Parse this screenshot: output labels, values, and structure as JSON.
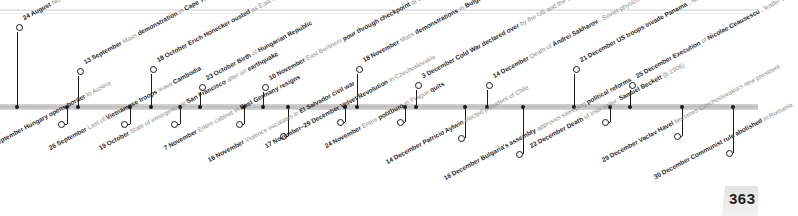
{
  "page": {
    "number": "363"
  },
  "timeline": {
    "events_above": [
      {
        "date": "24 August",
        "parts": [
          [
            "lt",
            "Non-"
          ],
          [
            "lt",
            "communist leader"
          ],
          [
            "md",
            "Tadeusz Mazowiecki"
          ],
          [
            "lt",
            "elected in Poland"
          ]
        ]
      },
      {
        "date": "13 September",
        "parts": [
          [
            "lt",
            "Mass"
          ],
          [
            "md",
            "demonstration"
          ],
          [
            "lt",
            "in"
          ],
          [
            "md",
            "Cape Town"
          ],
          [
            "lt",
            ", South Africa, against apartheid"
          ]
        ]
      },
      {
        "date": "18 October",
        "parts": [
          [
            "md",
            "Erich Honecker ousted"
          ],
          [
            "lt",
            "as East German leader"
          ]
        ]
      },
      {
        "date": "23 October",
        "parts": [
          [
            "md",
            "Birth"
          ],
          [
            "lt",
            "of"
          ],
          [
            "md",
            "Hungarian Republic"
          ]
        ]
      },
      {
        "date": "10 November",
        "parts": [
          [
            "lt",
            "East Berliners"
          ],
          [
            "md",
            "pour through checkpoint"
          ],
          [
            "lt",
            "at Berlin Wall to West Berlin"
          ]
        ]
      },
      {
        "date": "18 November",
        "parts": [
          [
            "lt",
            "Mass"
          ],
          [
            "md",
            "demonstrations"
          ],
          [
            "lt",
            "in"
          ],
          [
            "md",
            "Bulgaria"
          ],
          [
            "lt",
            "demanding reform"
          ]
        ]
      },
      {
        "date": "3 December",
        "parts": [
          [
            "md",
            "Cold War declared over"
          ],
          [
            "lt",
            "by the US and the USSR"
          ]
        ]
      },
      {
        "date": "14 December",
        "parts": [
          [
            "lt",
            "Death of"
          ],
          [
            "md",
            "Andrei Sakharov"
          ],
          [
            "lt",
            ", Soviet physicist (b.1921)"
          ]
        ]
      },
      {
        "date": "21 December",
        "parts": [
          [
            "md",
            "US troops invade Panama"
          ],
          [
            "lt",
            "; Noriega evades capture"
          ]
        ]
      },
      {
        "date": "25 December",
        "parts": [
          [
            "md",
            "Execution"
          ],
          [
            "lt",
            "of"
          ],
          [
            "md",
            "Nicolae Ceausescu"
          ],
          [
            "lt",
            ", leader of Romania (b.1918)"
          ]
        ]
      }
    ],
    "events_below": [
      {
        "date": "11 September",
        "parts": [
          [
            "md",
            "Hungary opens border"
          ],
          [
            "lt",
            "to Austria"
          ]
        ]
      },
      {
        "date": "26 September",
        "parts": [
          [
            "lt",
            "Last of"
          ],
          [
            "md",
            "Vietnamese troops"
          ],
          [
            "lt",
            "leave"
          ],
          [
            "md",
            "Cambodia"
          ]
        ]
      },
      {
        "date": "19 October",
        "parts": [
          [
            "lt",
            "State of emergency in"
          ],
          [
            "md",
            "San Francisco"
          ],
          [
            "lt",
            "after an"
          ],
          [
            "md",
            "earthquake"
          ]
        ]
      },
      {
        "date": "7 November",
        "parts": [
          [
            "lt",
            "Entire cabinet in"
          ],
          [
            "md",
            "East Germany resigns"
          ]
        ]
      },
      {
        "date": "16 November",
        "parts": [
          [
            "lt",
            "Violence escalates in"
          ],
          [
            "md",
            "El Salvador civil war"
          ]
        ]
      },
      {
        "date": "17 November–29 December",
        "parts": [
          [
            "md",
            "Velvet Revolution"
          ],
          [
            "lt",
            "in Czechoslovakia"
          ]
        ]
      },
      {
        "date": "24 November",
        "parts": [
          [
            "lt",
            "Entire"
          ],
          [
            "md",
            "politburo"
          ],
          [
            "lt",
            "in Prague"
          ],
          [
            "md",
            "quits"
          ]
        ]
      },
      {
        "date": "14 December",
        "parts": [
          [
            "md",
            "Patricio Aylwin"
          ],
          [
            "lt",
            "elected president of Chile"
          ]
        ]
      },
      {
        "date": "16 December",
        "parts": [
          [
            "md",
            "Bulgaria's assembly"
          ],
          [
            "lt",
            "approves sweeping"
          ],
          [
            "md",
            "political reforms"
          ]
        ]
      },
      {
        "date": "22 December",
        "parts": [
          [
            "md",
            "Death"
          ],
          [
            "lt",
            "of Irish writer,"
          ],
          [
            "md",
            "Samuel Beckett"
          ],
          [
            "lt",
            "(b.1906)"
          ]
        ]
      },
      {
        "date": "29 December",
        "parts": [
          [
            "md",
            "Vaclav Havel"
          ],
          [
            "lt",
            "becomes Czechoslovakia's new president"
          ]
        ]
      },
      {
        "date": "30 December",
        "parts": [
          [
            "md",
            "Communist rule abolished"
          ],
          [
            "lt",
            "in Romania"
          ]
        ]
      }
    ]
  }
}
